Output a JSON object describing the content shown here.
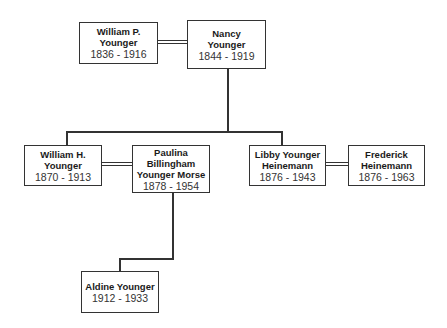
{
  "diagram": {
    "type": "family-tree",
    "people": [
      {
        "id": "william_p",
        "name_lines": [
          "William P.",
          "Younger"
        ],
        "dates": "1836 - 1916"
      },
      {
        "id": "nancy",
        "name_lines": [
          "Nancy",
          "Younger"
        ],
        "dates": "1844 - 1919"
      },
      {
        "id": "william_h",
        "name_lines": [
          "William H.",
          "Younger"
        ],
        "dates": "1870 - 1913"
      },
      {
        "id": "paulina",
        "name_lines": [
          "Paulina",
          "Billingham",
          "Younger Morse"
        ],
        "dates": "1878 - 1954"
      },
      {
        "id": "libby",
        "name_lines": [
          "Libby Younger",
          "Heinemann"
        ],
        "dates": "1876 - 1943"
      },
      {
        "id": "frederick",
        "name_lines": [
          "Frederick",
          "Heinemann"
        ],
        "dates": "1876 - 1963"
      },
      {
        "id": "aldine",
        "name_lines": [
          "Aldine Younger"
        ],
        "dates": "1912 - 1933"
      }
    ],
    "marriages": [
      [
        "william_p",
        "nancy"
      ],
      [
        "william_h",
        "paulina"
      ],
      [
        "libby",
        "frederick"
      ]
    ],
    "parent_child": [
      {
        "parents": [
          "william_p",
          "nancy"
        ],
        "children": [
          "william_h",
          "libby"
        ]
      },
      {
        "parents": [
          "william_h",
          "paulina"
        ],
        "children": [
          "aldine"
        ]
      }
    ]
  }
}
